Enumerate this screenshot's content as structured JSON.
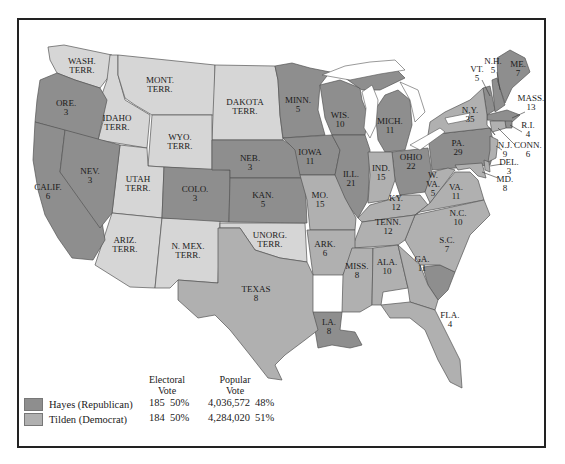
{
  "colors": {
    "republican": "#8e8e8e",
    "democrat": "#b0b0b0",
    "territory": "#d6d6d6",
    "water": "#ffffff",
    "border": "#555555"
  },
  "legend": {
    "electoral_header_1": "Electoral",
    "electoral_header_2": "Vote",
    "popular_header_1": "Popular",
    "popular_header_2": "Vote",
    "rows": [
      {
        "party": "Hayes (Republican)",
        "electoral": "185",
        "electoral_pct": "50%",
        "popular": "4,036,572",
        "popular_pct": "48%"
      },
      {
        "party": "Tilden (Democrat)",
        "electoral": "184",
        "electoral_pct": "50%",
        "popular": "4,284,020",
        "popular_pct": "51%"
      }
    ]
  },
  "states": {
    "wash": {
      "name": "WASH.",
      "sub": "TERR."
    },
    "mont": {
      "name": "MONT.",
      "sub": "TERR."
    },
    "dakota": {
      "name": "DAKOTA",
      "sub": "TERR."
    },
    "idaho": {
      "name": "IDAHO",
      "sub": "TERR."
    },
    "wyo": {
      "name": "WYO.",
      "sub": "TERR."
    },
    "ore": {
      "name": "ORE.",
      "sub": "3"
    },
    "nev": {
      "name": "NEV.",
      "sub": "3"
    },
    "calif": {
      "name": "CALIF.",
      "sub": "6"
    },
    "utah": {
      "name": "UTAH",
      "sub": "TERR."
    },
    "colo": {
      "name": "COLO.",
      "sub": "3"
    },
    "ariz": {
      "name": "ARIZ.",
      "sub": "TERR."
    },
    "nmex": {
      "name": "N. MEX.",
      "sub": "TERR."
    },
    "minn": {
      "name": "MINN.",
      "sub": "5"
    },
    "neb": {
      "name": "NEB.",
      "sub": "3"
    },
    "kan": {
      "name": "KAN.",
      "sub": "5"
    },
    "iowa": {
      "name": "IOWA",
      "sub": "11"
    },
    "wis": {
      "name": "WIS.",
      "sub": "10"
    },
    "ill": {
      "name": "ILL.",
      "sub": "21"
    },
    "mo": {
      "name": "MO.",
      "sub": "15"
    },
    "unorg": {
      "name": "UNORG.",
      "sub": "TERR."
    },
    "texas": {
      "name": "TEXAS",
      "sub": "8"
    },
    "ark": {
      "name": "ARK.",
      "sub": "6"
    },
    "la": {
      "name": "LA.",
      "sub": "8"
    },
    "miss": {
      "name": "MISS.",
      "sub": "8"
    },
    "mich": {
      "name": "MICH.",
      "sub": "11"
    },
    "ind": {
      "name": "IND.",
      "sub": "15"
    },
    "ohio": {
      "name": "OHIO",
      "sub": "22"
    },
    "ky": {
      "name": "KY.",
      "sub": "12"
    },
    "tenn": {
      "name": "TENN.",
      "sub": "12"
    },
    "ala": {
      "name": "ALA.",
      "sub": "10"
    },
    "ga": {
      "name": "GA.",
      "sub": "11"
    },
    "fla": {
      "name": "FLA.",
      "sub": "4"
    },
    "sc": {
      "name": "S.C.",
      "sub": "7"
    },
    "nc": {
      "name": "N.C.",
      "sub": "10"
    },
    "va": {
      "name": "VA.",
      "sub": "11"
    },
    "wva_1": {
      "name": "W.",
      "sub": "VA."
    },
    "wva_2": {
      "sub": "5"
    },
    "pa": {
      "name": "PA.",
      "sub": "29"
    },
    "ny": {
      "name": "N.Y.",
      "sub": "35"
    },
    "vt": {
      "name": "VT.",
      "sub": "5"
    },
    "nh": {
      "name": "N.H.",
      "sub": "5"
    },
    "me": {
      "name": "ME.",
      "sub": "7"
    },
    "mass": {
      "name": "MASS.",
      "sub": "13"
    },
    "ri": {
      "name": "R.I.",
      "sub": "4"
    },
    "conn": {
      "name": "CONN.",
      "sub": "6"
    },
    "nj": {
      "name": "N.J.",
      "sub": "9"
    },
    "del": {
      "name": "DEL.",
      "sub": "3"
    },
    "md": {
      "name": "MD.",
      "sub": "8"
    }
  }
}
